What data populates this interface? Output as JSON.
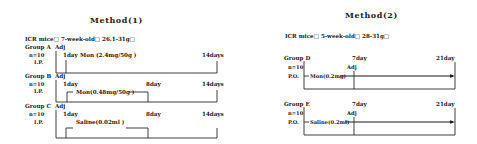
{
  "method1": {
    "title": "Method(1)",
    "subjects": "ICR mice□ 7-week-old□ 26.1-31g□",
    "groups": [
      {
        "label": "Group A",
        "adj": "Adj",
        "n": "n=10",
        "route": "I.P.",
        "start": "1day",
        "treatment": "Mon (2.4mg/50g )",
        "end": "14days"
      },
      {
        "label": "Group B",
        "adj": "Adj",
        "n": "n=10",
        "route": "I.P.",
        "start": "1day",
        "mid": "8day",
        "treatment": "Mon(0.48mg/50g )",
        "end": "14days"
      },
      {
        "label": "Group C",
        "adj": "Adj",
        "n": "n=10",
        "route": "I.P.",
        "start": "1day",
        "mid": "8day",
        "treatment": "Saline(0.02ml )",
        "end": "14days"
      }
    ]
  },
  "method2": {
    "title": "Method(2)",
    "subjects": "ICR mice□ 5-week-old□ 28-31g□",
    "groups": [
      {
        "label": "Group D",
        "n": "n=10",
        "route": "P.O.",
        "mid": "7day",
        "adj": "Adj",
        "treatment": "Mon(0.2mg)",
        "end": "21day"
      },
      {
        "label": "Group E",
        "n": "n=10",
        "route": "P.O.",
        "mid": "7day",
        "adj": "Adj",
        "treatment": "Saline(0.2ml)",
        "end": "21day"
      }
    ]
  }
}
